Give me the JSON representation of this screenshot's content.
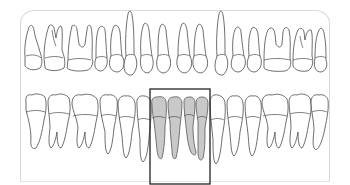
{
  "diagram": {
    "colors": {
      "tooth_fill": "#ffffff",
      "tooth_outline": "#4a4a4a",
      "selected_fill": "#c9c9c9",
      "selection_box": "#222222",
      "panel_border": "#d9d9d9"
    },
    "upper_arch": {
      "teeth": [
        {
          "type": "molar",
          "selected": false
        },
        {
          "type": "molar",
          "selected": false
        },
        {
          "type": "molar",
          "selected": false
        },
        {
          "type": "premolar",
          "selected": false
        },
        {
          "type": "premolar",
          "selected": false
        },
        {
          "type": "canine",
          "selected": false
        },
        {
          "type": "incisor",
          "selected": false
        },
        {
          "type": "incisor",
          "selected": false
        },
        {
          "type": "incisor",
          "selected": false
        },
        {
          "type": "incisor",
          "selected": false
        },
        {
          "type": "canine",
          "selected": false
        },
        {
          "type": "premolar",
          "selected": false
        },
        {
          "type": "premolar",
          "selected": false
        },
        {
          "type": "molar",
          "selected": false
        },
        {
          "type": "molar",
          "selected": false
        },
        {
          "type": "molar",
          "selected": false
        }
      ]
    },
    "lower_arch": {
      "teeth": [
        {
          "type": "molar",
          "selected": false
        },
        {
          "type": "molar",
          "selected": false
        },
        {
          "type": "molar",
          "selected": false
        },
        {
          "type": "premolar",
          "selected": false
        },
        {
          "type": "premolar",
          "selected": false
        },
        {
          "type": "canine",
          "selected": false
        },
        {
          "type": "incisor",
          "selected": true
        },
        {
          "type": "incisor",
          "selected": true
        },
        {
          "type": "incisor",
          "selected": true
        },
        {
          "type": "incisor",
          "selected": true
        },
        {
          "type": "canine",
          "selected": false
        },
        {
          "type": "premolar",
          "selected": false
        },
        {
          "type": "premolar",
          "selected": false
        },
        {
          "type": "molar",
          "selected": false
        },
        {
          "type": "molar",
          "selected": false
        },
        {
          "type": "molar",
          "selected": false
        }
      ]
    },
    "selection": {
      "label": "Lower incisors",
      "arch": "lower",
      "tooth_indices": [
        6,
        7,
        8,
        9
      ],
      "box": {
        "x": 150,
        "y": 89,
        "width": 60,
        "height": 95
      }
    }
  }
}
